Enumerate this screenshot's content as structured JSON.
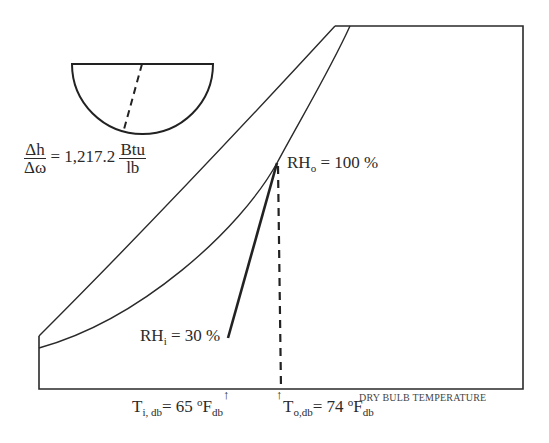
{
  "diagram": {
    "type": "psychrometric-chart-sketch",
    "protractor": {
      "slope_label": {
        "numerator": "Δh",
        "denominator": "Δω",
        "equals": "= 1,217.2",
        "unit_numerator": "Btu",
        "unit_denominator": "lb"
      }
    },
    "outlet_state": {
      "label_main": "RH",
      "label_sub": "o",
      "label_value": "= 100 %"
    },
    "inlet_state": {
      "label_main": "RH",
      "label_sub": "i",
      "label_value": "= 30 %"
    },
    "x_axis": {
      "title": "DRY BULB TEMPERATURE",
      "inlet_temp": {
        "symbol": "T",
        "sub": "i, db",
        "value": "= 65 ",
        "deg": "o",
        "unit": "F",
        "unit_sub": "db",
        "arrow": "↑"
      },
      "outlet_temp": {
        "symbol": "T",
        "sub": "o,db",
        "value": "= 74 ",
        "deg": "o",
        "unit": "F",
        "unit_sub": "db",
        "arrow": "↑"
      }
    },
    "colors": {
      "line": "#2a2a2a",
      "background": "#ffffff"
    }
  }
}
